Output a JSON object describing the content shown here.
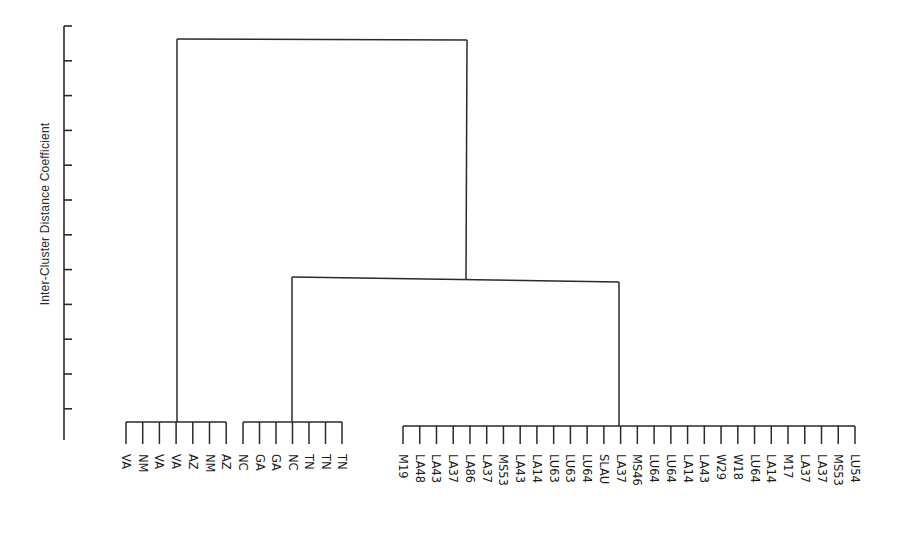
{
  "chart_data": {
    "type": "dendrogram",
    "title": "",
    "xlabel": "",
    "ylabel": "Inter-Cluster Distance Coefficient",
    "y_tick_count": 12,
    "y_tick_labels": [],
    "grid": false,
    "leaves": [
      "VA",
      "NM",
      "VA",
      "VA",
      "AZ",
      "NM",
      "AZ",
      "NC",
      "GA",
      "GA",
      "NC",
      "TN",
      "TN",
      "TN",
      "M19",
      "LA48",
      "LA43",
      "LA37",
      "LA86",
      "LA37",
      "MS53",
      "LA43",
      "LA14",
      "LU63",
      "LU63",
      "LU64",
      "SLAU",
      "LA37",
      "MS46",
      "LU64",
      "LU64",
      "LA14",
      "LA43",
      "W29",
      "W18",
      "LU64",
      "LA14",
      "M17",
      "LA37",
      "LA37",
      "MS53",
      "LU54"
    ],
    "clusters": [
      {
        "name": "Southwest (VA/NM/AZ)",
        "leaves": [
          "VA",
          "NM",
          "VA",
          "VA",
          "AZ",
          "NM",
          "AZ"
        ],
        "merge_height_relative": 0.05
      },
      {
        "name": "Southeast (NC/GA/TN)",
        "leaves": [
          "NC",
          "GA",
          "GA",
          "NC",
          "TN",
          "TN",
          "TN"
        ],
        "merge_height_relative": 0.05
      },
      {
        "name": "Gulf/Midwest group",
        "leaves": [
          "M19",
          "LA48",
          "LA43",
          "LA37",
          "LA86",
          "LA37",
          "MS53",
          "LA43",
          "LA14",
          "LU63",
          "LU63",
          "LU64",
          "SLAU",
          "LA37",
          "MS46",
          "LU64",
          "LU64",
          "LA14",
          "LA43",
          "W29",
          "W18",
          "LU64",
          "LA14",
          "M17",
          "LA37",
          "LA37",
          "MS53",
          "LU54"
        ],
        "merge_height_relative": 0.05
      }
    ],
    "merges": [
      {
        "join": [
          "Southeast (NC/GA/TN)",
          "Gulf/Midwest group"
        ],
        "height_relative": 0.39
      },
      {
        "join": [
          "Southwest (VA/NM/AZ)",
          "Southeast+Gulf"
        ],
        "height_relative": 0.97
      }
    ]
  }
}
